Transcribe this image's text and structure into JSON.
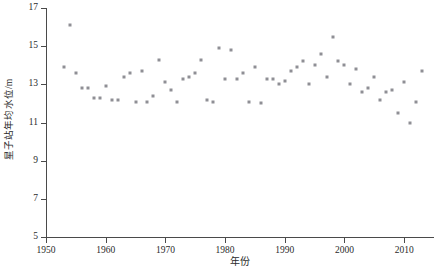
{
  "chart_data": {
    "type": "scatter",
    "title": "",
    "xlabel": "年份",
    "ylabel": "星子站年均水位/m",
    "xlim": [
      1950,
      2015
    ],
    "ylim": [
      5,
      17
    ],
    "xticks": [
      1950,
      1960,
      1970,
      1980,
      1990,
      2000,
      2010
    ],
    "xtick_labels": [
      "1950",
      "1960",
      "1970",
      "1980",
      "1990",
      "2000",
      "2010"
    ],
    "yticks": [
      5,
      7,
      9,
      11,
      13,
      15,
      17
    ],
    "ytick_labels": [
      "5",
      "7",
      "9",
      "11",
      "13",
      "15",
      "17"
    ],
    "grid": false,
    "legend": null,
    "marker": "square",
    "marker_color": "#8f8f95",
    "marker_size_px": 3,
    "series": [
      {
        "name": "星子站年均水位",
        "x": [
          1953,
          1954,
          1955,
          1956,
          1957,
          1958,
          1959,
          1960,
          1961,
          1962,
          1963,
          1964,
          1965,
          1966,
          1967,
          1968,
          1969,
          1970,
          1971,
          1972,
          1973,
          1974,
          1975,
          1976,
          1977,
          1978,
          1979,
          1980,
          1981,
          1982,
          1983,
          1984,
          1985,
          1986,
          1987,
          1988,
          1989,
          1990,
          1991,
          1992,
          1993,
          1994,
          1995,
          1996,
          1997,
          1998,
          1999,
          2000,
          2001,
          2002,
          2003,
          2004,
          2005,
          2006,
          2007,
          2008,
          2009,
          2010,
          2011,
          2012,
          2013
        ],
        "y": [
          13.9,
          16.1,
          13.6,
          12.8,
          12.8,
          12.3,
          12.3,
          12.9,
          12.2,
          12.2,
          13.4,
          13.6,
          12.1,
          13.7,
          12.1,
          12.4,
          14.3,
          13.1,
          12.7,
          12.1,
          13.3,
          13.4,
          13.6,
          14.3,
          12.2,
          12.1,
          14.9,
          13.3,
          14.8,
          13.3,
          13.6,
          12.1,
          13.9,
          12.0,
          13.3,
          13.3,
          13.0,
          13.2,
          13.7,
          13.9,
          14.2,
          13.0,
          14.0,
          14.6,
          13.4,
          15.5,
          14.2,
          14.0,
          13.0,
          13.8,
          12.6,
          12.8,
          13.4,
          12.2,
          12.6,
          12.7,
          11.5,
          13.1,
          11.0,
          12.1,
          13.7
        ]
      }
    ]
  },
  "axis": {
    "y_title": "星子站年均水位/m",
    "x_title": "年份"
  },
  "caption": {
    "text": ""
  }
}
